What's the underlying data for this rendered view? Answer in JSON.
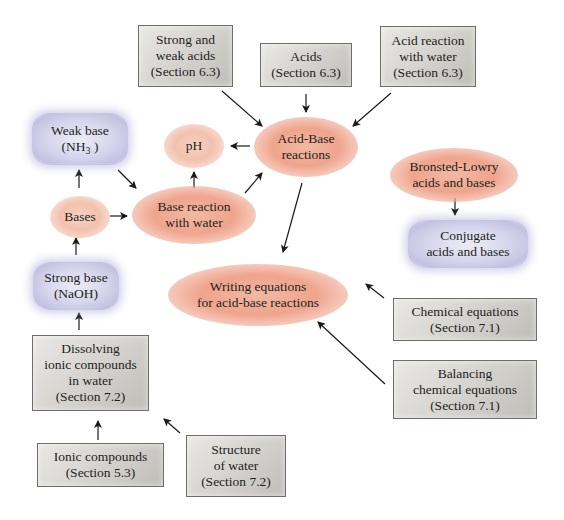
{
  "diagram": {
    "type": "concept-map",
    "topic": "Acid-Base reactions"
  },
  "nodes": {
    "strong_weak_acids": {
      "line1": "Strong and",
      "line2": "weak acids",
      "line3": "(Section 6.3)",
      "shape": "box"
    },
    "acids": {
      "line1": "Acids",
      "line2": "(Section 6.3)",
      "shape": "box"
    },
    "acid_reaction_water": {
      "line1": "Acid reaction",
      "line2": "with water",
      "line3": "(Section 6.3)",
      "shape": "box"
    },
    "weak_base": {
      "line1": "Weak base",
      "line2_prefix": "(NH",
      "line2_sub": "3",
      "line2_suffix": " )",
      "shape": "rounded-lavender"
    },
    "ph": {
      "line1": "pH",
      "shape": "ellipse"
    },
    "acid_base_reactions": {
      "line1": "Acid-Base",
      "line2": "reactions",
      "shape": "ellipse"
    },
    "bronsted_lowry": {
      "line1": "Bronsted-Lowry",
      "line2": "acids and bases",
      "shape": "ellipse"
    },
    "bases": {
      "line1": "Bases",
      "shape": "ellipse"
    },
    "base_reaction_water": {
      "line1": "Base reaction",
      "line2": "with water",
      "shape": "ellipse"
    },
    "conjugate": {
      "line1": "Conjugate",
      "line2": "acids and bases",
      "shape": "rounded-lavender"
    },
    "strong_base": {
      "line1": "Strong base",
      "line2": "(NaOH)",
      "shape": "rounded-lavender"
    },
    "writing_equations": {
      "line1": "Writing equations",
      "line2": "for acid-base reactions",
      "shape": "ellipse"
    },
    "chemical_equations": {
      "line1": "Chemical equations",
      "line2": "(Section 7.1)",
      "shape": "box"
    },
    "dissolving": {
      "line1": "Dissolving",
      "line2": "ionic compounds",
      "line3": "in water",
      "line4": "(Section 7.2)",
      "shape": "box"
    },
    "balancing": {
      "line1": "Balancing",
      "line2": "chemical equations",
      "line3": "(Section 7.1)",
      "shape": "box"
    },
    "ionic_compounds": {
      "line1": "Ionic compounds",
      "line2": "(Section 5.3)",
      "shape": "box"
    },
    "structure_water": {
      "line1": "Structure",
      "line2": "of water",
      "line3": "(Section 7.2)",
      "shape": "box"
    }
  },
  "edges": [
    {
      "from": "strong_weak_acids",
      "to": "acid_base_reactions"
    },
    {
      "from": "acids",
      "to": "acid_base_reactions"
    },
    {
      "from": "acid_reaction_water",
      "to": "acid_base_reactions"
    },
    {
      "from": "acid_base_reactions",
      "to": "ph"
    },
    {
      "from": "acid_base_reactions",
      "to": "writing_equations"
    },
    {
      "from": "base_reaction_water",
      "to": "ph"
    },
    {
      "from": "base_reaction_water",
      "to": "acid_base_reactions"
    },
    {
      "from": "weak_base",
      "to": "base_reaction_water"
    },
    {
      "from": "bases",
      "to": "weak_base"
    },
    {
      "from": "bases",
      "to": "base_reaction_water"
    },
    {
      "from": "strong_base",
      "to": "bases"
    },
    {
      "from": "dissolving",
      "to": "strong_base"
    },
    {
      "from": "ionic_compounds",
      "to": "dissolving"
    },
    {
      "from": "structure_water",
      "to": "dissolving"
    },
    {
      "from": "bronsted_lowry",
      "to": "conjugate"
    },
    {
      "from": "chemical_equations",
      "to": "writing_equations"
    },
    {
      "from": "balancing",
      "to": "writing_equations"
    }
  ],
  "colors": {
    "box_fill": "#d2d1cc",
    "box_border": "#6e6d69",
    "ellipse_fill": "#efa48c",
    "lavender_fill": "#d6d5ec",
    "arrow": "#1a1a1a",
    "text": "#231f20"
  }
}
